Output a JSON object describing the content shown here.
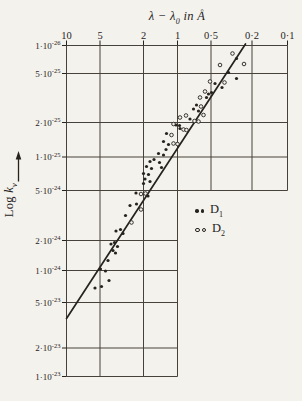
{
  "page": {
    "background": "#f4f2ec",
    "ink": "#26231f",
    "grid_color": "#46423b"
  },
  "title": {
    "pre": "λ − λ",
    "sub": "0",
    "post": " in Å"
  },
  "y_axis_label": {
    "base": "Log ",
    "ital": "k",
    "sub": "ν"
  },
  "legend": {
    "items": [
      {
        "base": "D",
        "sub": "1",
        "marker": "filled-dot",
        "series": "D1"
      },
      {
        "base": "D",
        "sub": "2",
        "marker": "open-dot",
        "series": "D2"
      }
    ]
  },
  "chart_data": {
    "type": "scatter",
    "title": "",
    "xlabel": "λ − λ0 in Å",
    "ylabel": "Log kν",
    "grid": "on",
    "legend_position": "middle-right",
    "x_axis": {
      "scale": "log",
      "direction": "values decrease to the right",
      "unit": "Å",
      "ticks": [
        {
          "label": "10",
          "value": 10,
          "px": 66.5
        },
        {
          "label": "5",
          "value": 5,
          "px": 100
        },
        {
          "label": "2",
          "value": 2,
          "px": 143.5
        },
        {
          "label": "1",
          "value": 1,
          "px": 177.5
        },
        {
          "label": "0·5",
          "value": 0.5,
          "px": 211
        },
        {
          "label": "0·2",
          "value": 0.2,
          "px": 252
        },
        {
          "label": "0·1",
          "value": 0.1,
          "px": 287.5
        }
      ]
    },
    "y_axis": {
      "scale": "log",
      "ticks": [
        {
          "label": "1·10^-26",
          "px": 45.5
        },
        {
          "label": "5·10^-25",
          "px": 73.5
        },
        {
          "label": "2·10^-25",
          "px": 122.5
        },
        {
          "label": "1·10^-25",
          "px": 157
        },
        {
          "label": "5·10^-24",
          "px": 190.5
        },
        {
          "label": "2·10^-24",
          "px": 240.5
        },
        {
          "label": "1·10^-24",
          "px": 270.5
        },
        {
          "label": "5·10^-23",
          "px": 302.5
        },
        {
          "label": "2·10^-23",
          "px": 348
        },
        {
          "label": "1·10^-23",
          "px": 376.5
        }
      ]
    },
    "plot": {
      "left": 66.5,
      "right": 287.5,
      "top": 45.5,
      "band_split_y": 190.5,
      "lower_right": 177.5,
      "bottom": 376.5
    },
    "fit_line": {
      "x1": 66.5,
      "y1": 318.5,
      "x2": 245.5,
      "y2": 44
    },
    "series": [
      {
        "name": "D1",
        "marker": "filled-dot",
        "points_px": [
          [
            95,
            288
          ],
          [
            101.5,
            286.5
          ],
          [
            109,
            280.5
          ],
          [
            100.5,
            269
          ],
          [
            105.5,
            271
          ],
          [
            108,
            260.5
          ],
          [
            113,
            250.5
          ],
          [
            115.5,
            253
          ],
          [
            111,
            244
          ],
          [
            114.5,
            242.5
          ],
          [
            117.5,
            246.5
          ],
          [
            116,
            231
          ],
          [
            120.5,
            229.5
          ],
          [
            123,
            233.5
          ],
          [
            125.5,
            215.5
          ],
          [
            130,
            205.5
          ],
          [
            136.5,
            204
          ],
          [
            136,
            193
          ],
          [
            148,
            196
          ],
          [
            143.5,
            183.5
          ],
          [
            150,
            181.5
          ],
          [
            145,
            179
          ],
          [
            143.5,
            173.5
          ],
          [
            148.5,
            174.5
          ],
          [
            146.5,
            166.5
          ],
          [
            151.5,
            168.5
          ],
          [
            161.5,
            167.5
          ],
          [
            150,
            161.5
          ],
          [
            154,
            159.5
          ],
          [
            159.5,
            162.5
          ],
          [
            158.5,
            153.5
          ],
          [
            163.5,
            155
          ],
          [
            166,
            149.5
          ],
          [
            168.5,
            144.5
          ],
          [
            163.5,
            141.5
          ],
          [
            166.5,
            133.5
          ],
          [
            176,
            125
          ],
          [
            179.5,
            125.5
          ],
          [
            180,
            128.5
          ],
          [
            190,
            119
          ],
          [
            193.5,
            109
          ],
          [
            196.5,
            105
          ],
          [
            198.5,
            111
          ],
          [
            206.5,
            97.5
          ],
          [
            208.5,
            94
          ],
          [
            211.5,
            92.5
          ],
          [
            215,
            83.5
          ],
          [
            222,
            87.5
          ],
          [
            228.5,
            72.5
          ],
          [
            236.5,
            78.5
          ],
          [
            236.5,
            58.5
          ]
        ]
      },
      {
        "name": "D2",
        "marker": "open-dot",
        "points_px": [
          [
            131.5,
            222.5
          ],
          [
            141,
            209.5
          ],
          [
            141,
            194
          ],
          [
            145.5,
            193.5
          ],
          [
            171.5,
            135
          ],
          [
            173.5,
            143.5
          ],
          [
            177.5,
            144
          ],
          [
            173.5,
            124
          ],
          [
            183.5,
            129.5
          ],
          [
            186.5,
            130
          ],
          [
            180,
            117.5
          ],
          [
            186,
            115.5
          ],
          [
            194.5,
            121
          ],
          [
            198.5,
            121.5
          ],
          [
            201,
            106.5
          ],
          [
            203.5,
            115
          ],
          [
            200,
            97.5
          ],
          [
            205,
            91.5
          ],
          [
            210,
            81.5
          ],
          [
            224.5,
            82.5
          ],
          [
            220,
            65
          ],
          [
            232.5,
            53.5
          ],
          [
            244,
            64
          ]
        ]
      }
    ]
  }
}
